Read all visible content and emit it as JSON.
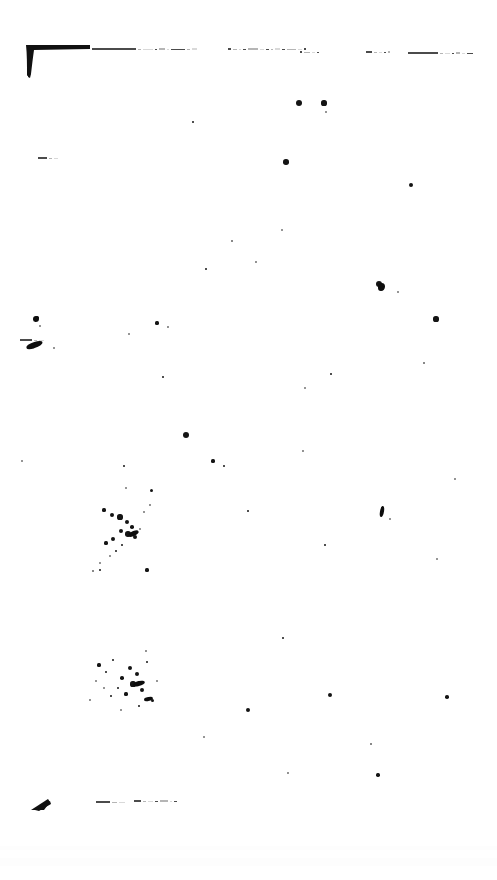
{
  "document": {
    "title": "Scanned page",
    "page_background": "#ffffff",
    "ink_color": "#141414",
    "width_px": 497,
    "height_px": 880,
    "condition": "heavily degraded bitonal scan; body text not legible",
    "legible_text": []
  },
  "marks": {
    "top_left_corner": {
      "name": "top-left-corner-mark",
      "x": 24,
      "y": 43,
      "w": 68,
      "h": 34
    },
    "bottom_left_corner": {
      "name": "bottom-left-corner-mark",
      "x": 30,
      "y": 798,
      "w": 22,
      "h": 13
    }
  },
  "ghost_lines": [
    {
      "x": 92,
      "y": 48,
      "segments": [
        44,
        3,
        10,
        2,
        6,
        2,
        14,
        3,
        5
      ]
    },
    {
      "x": 228,
      "y": 48,
      "segments": [
        3,
        4,
        2,
        3,
        10,
        4,
        3,
        2,
        5,
        3,
        9,
        4,
        2
      ]
    },
    {
      "x": 300,
      "y": 51,
      "segments": [
        2,
        6,
        3,
        2
      ]
    },
    {
      "x": 366,
      "y": 51,
      "segments": [
        6,
        3,
        3,
        2,
        2
      ]
    },
    {
      "x": 408,
      "y": 52,
      "segments": [
        30,
        3,
        5,
        2,
        4,
        3,
        6
      ]
    },
    {
      "x": 96,
      "y": 801,
      "segments": [
        14,
        5,
        6
      ]
    },
    {
      "x": 134,
      "y": 800,
      "segments": [
        7,
        3,
        5,
        3,
        8,
        2,
        3
      ]
    },
    {
      "x": 38,
      "y": 157,
      "segments": [
        9,
        3,
        4
      ]
    },
    {
      "x": 20,
      "y": 339,
      "segments": [
        12,
        3,
        5
      ]
    }
  ],
  "speckles": [
    {
      "x": 299,
      "y": 103,
      "r": 3.0
    },
    {
      "x": 324,
      "y": 103,
      "r": 2.6
    },
    {
      "x": 326,
      "y": 112,
      "r": 1.0
    },
    {
      "x": 193,
      "y": 122,
      "r": 1.4
    },
    {
      "x": 286,
      "y": 162,
      "r": 2.8
    },
    {
      "x": 411,
      "y": 185,
      "r": 2.4
    },
    {
      "x": 282,
      "y": 230,
      "r": 1.0
    },
    {
      "x": 232,
      "y": 241,
      "r": 0.8
    },
    {
      "x": 206,
      "y": 269,
      "r": 1.2
    },
    {
      "x": 256,
      "y": 262,
      "r": 0.9
    },
    {
      "x": 379,
      "y": 284,
      "r": 3.0
    },
    {
      "x": 398,
      "y": 292,
      "r": 1.1
    },
    {
      "x": 436,
      "y": 319,
      "r": 2.6
    },
    {
      "x": 157,
      "y": 323,
      "r": 1.6
    },
    {
      "x": 168,
      "y": 327,
      "r": 0.9
    },
    {
      "x": 129,
      "y": 334,
      "r": 1.1
    },
    {
      "x": 331,
      "y": 374,
      "r": 1.3
    },
    {
      "x": 163,
      "y": 377,
      "r": 1.2
    },
    {
      "x": 424,
      "y": 363,
      "r": 0.8
    },
    {
      "x": 305,
      "y": 388,
      "r": 1.0
    },
    {
      "x": 186,
      "y": 435,
      "r": 3.0
    },
    {
      "x": 213,
      "y": 461,
      "r": 1.6
    },
    {
      "x": 224,
      "y": 466,
      "r": 1.2
    },
    {
      "x": 22,
      "y": 461,
      "r": 1.0
    },
    {
      "x": 124,
      "y": 466,
      "r": 1.4
    },
    {
      "x": 303,
      "y": 451,
      "r": 0.9
    },
    {
      "x": 126,
      "y": 488,
      "r": 1.0
    },
    {
      "x": 151,
      "y": 490,
      "r": 1.5
    },
    {
      "x": 248,
      "y": 511,
      "r": 1.4
    },
    {
      "x": 382,
      "y": 508,
      "r": 1.4
    },
    {
      "x": 390,
      "y": 519,
      "r": 1.0
    },
    {
      "x": 455,
      "y": 479,
      "r": 0.9
    },
    {
      "x": 325,
      "y": 545,
      "r": 1.2
    },
    {
      "x": 437,
      "y": 559,
      "r": 1.1
    },
    {
      "x": 100,
      "y": 570,
      "r": 1.3
    },
    {
      "x": 147,
      "y": 570,
      "r": 1.6
    },
    {
      "x": 283,
      "y": 638,
      "r": 1.2
    },
    {
      "x": 248,
      "y": 710,
      "r": 2.0
    },
    {
      "x": 330,
      "y": 695,
      "r": 2.2
    },
    {
      "x": 447,
      "y": 697,
      "r": 1.8
    },
    {
      "x": 378,
      "y": 775,
      "r": 1.7
    },
    {
      "x": 204,
      "y": 737,
      "r": 1.0
    },
    {
      "x": 371,
      "y": 744,
      "r": 0.8
    },
    {
      "x": 288,
      "y": 773,
      "r": 0.9
    },
    {
      "x": 37,
      "y": 318,
      "r": 2.2
    },
    {
      "x": 40,
      "y": 326,
      "r": 1.0
    },
    {
      "x": 54,
      "y": 348,
      "r": 1.1
    },
    {
      "x": 104,
      "y": 510,
      "r": 1.6
    },
    {
      "x": 112,
      "y": 515,
      "r": 2.0
    },
    {
      "x": 120,
      "y": 517,
      "r": 2.6
    },
    {
      "x": 127,
      "y": 522,
      "r": 2.2
    },
    {
      "x": 132,
      "y": 527,
      "r": 1.8
    },
    {
      "x": 121,
      "y": 531,
      "r": 2.4
    },
    {
      "x": 128,
      "y": 534,
      "r": 2.8
    },
    {
      "x": 135,
      "y": 537,
      "r": 2.0
    },
    {
      "x": 113,
      "y": 539,
      "r": 2.2
    },
    {
      "x": 106,
      "y": 543,
      "r": 1.6
    },
    {
      "x": 122,
      "y": 545,
      "r": 1.4
    },
    {
      "x": 116,
      "y": 551,
      "r": 1.2
    },
    {
      "x": 110,
      "y": 556,
      "r": 1.0
    },
    {
      "x": 100,
      "y": 563,
      "r": 1.1
    },
    {
      "x": 144,
      "y": 512,
      "r": 1.0
    },
    {
      "x": 150,
      "y": 505,
      "r": 0.9
    },
    {
      "x": 93,
      "y": 571,
      "r": 0.8
    },
    {
      "x": 140,
      "y": 529,
      "r": 1.0
    },
    {
      "x": 99,
      "y": 665,
      "r": 1.6
    },
    {
      "x": 106,
      "y": 672,
      "r": 1.2
    },
    {
      "x": 113,
      "y": 660,
      "r": 1.4
    },
    {
      "x": 122,
      "y": 678,
      "r": 1.8
    },
    {
      "x": 130,
      "y": 668,
      "r": 2.4
    },
    {
      "x": 137,
      "y": 674,
      "r": 2.0
    },
    {
      "x": 133,
      "y": 684,
      "r": 2.6
    },
    {
      "x": 142,
      "y": 690,
      "r": 2.2
    },
    {
      "x": 126,
      "y": 694,
      "r": 1.6
    },
    {
      "x": 118,
      "y": 688,
      "r": 1.4
    },
    {
      "x": 111,
      "y": 696,
      "r": 1.2
    },
    {
      "x": 104,
      "y": 688,
      "r": 1.0
    },
    {
      "x": 96,
      "y": 681,
      "r": 1.1
    },
    {
      "x": 147,
      "y": 662,
      "r": 1.3
    },
    {
      "x": 152,
      "y": 700,
      "r": 1.5
    },
    {
      "x": 139,
      "y": 706,
      "r": 1.2
    },
    {
      "x": 121,
      "y": 710,
      "r": 1.0
    },
    {
      "x": 90,
      "y": 700,
      "r": 0.9
    },
    {
      "x": 157,
      "y": 681,
      "r": 1.1
    },
    {
      "x": 146,
      "y": 651,
      "r": 0.9
    }
  ],
  "blobs": [
    {
      "x": 26,
      "y": 342,
      "w": 17,
      "h": 6,
      "rot": -18,
      "name": "ink-blob-left-upper"
    },
    {
      "x": 33,
      "y": 316,
      "w": 6,
      "h": 6,
      "rot": 0,
      "name": "ink-blob-left-dot"
    },
    {
      "x": 380,
      "y": 506,
      "w": 4,
      "h": 11,
      "rot": 8,
      "name": "ink-blob-right-stroke"
    },
    {
      "x": 378,
      "y": 283,
      "w": 7,
      "h": 8,
      "rot": 0,
      "name": "ink-blob-upper-right"
    },
    {
      "x": 133,
      "y": 681,
      "w": 12,
      "h": 5,
      "rot": -12,
      "name": "ink-blob-center-lower"
    },
    {
      "x": 128,
      "y": 531,
      "w": 11,
      "h": 5,
      "rot": -20,
      "name": "ink-blob-center-upper"
    },
    {
      "x": 144,
      "y": 697,
      "w": 9,
      "h": 4,
      "rot": -10,
      "name": "ink-blob-center-tail"
    }
  ],
  "paper_tints": [
    {
      "x": 0,
      "y": 858,
      "w": 497,
      "h": 8
    },
    {
      "x": 0,
      "y": 846,
      "w": 497,
      "h": 4
    }
  ]
}
